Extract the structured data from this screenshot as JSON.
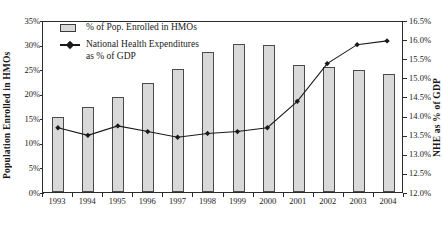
{
  "chart_data": {
    "type": "bar",
    "title": "",
    "subtitle": "",
    "xlabel": "",
    "ylabel": "Population  Enrolled  in  HMOs",
    "y2label": "NHE as % of GDP",
    "categories": [
      "1993",
      "1994",
      "1995",
      "1996",
      "1997",
      "1998",
      "1999",
      "2000",
      "2001",
      "2002",
      "2003",
      "2004"
    ],
    "grid": false,
    "legend_position": "top-left",
    "ylim": [
      0,
      35
    ],
    "y2lim": [
      12.0,
      16.5
    ],
    "yticks": [
      "0%",
      "5%",
      "10%",
      "15%",
      "20%",
      "25%",
      "30%",
      "35%"
    ],
    "ytick_values": [
      0,
      5,
      10,
      15,
      20,
      25,
      30,
      35
    ],
    "y2ticks": [
      "12.0%",
      "12.5%",
      "13.0%",
      "13.5%",
      "14.0%",
      "14.5%",
      "15.0%",
      "15.5%",
      "16.0%",
      "16.5%"
    ],
    "y2tick_values": [
      12.0,
      12.5,
      13.0,
      13.5,
      14.0,
      14.5,
      15.0,
      15.5,
      16.0,
      16.5
    ],
    "series": [
      {
        "name": "% of Pop. Enrolled in HMOs",
        "type": "bar",
        "axis": "left",
        "unit": "%",
        "color": "#d9d9d9",
        "edge_color": "#4a4a4a",
        "values": [
          15.2,
          17.3,
          19.4,
          22.1,
          25.0,
          28.4,
          30.2,
          30.0,
          25.8,
          25.4,
          24.8,
          24.0
        ]
      },
      {
        "name": "National Health Expenditures\nas % of GDP",
        "type": "line",
        "axis": "right",
        "unit": "%",
        "color": "#1a1a1a",
        "marker": "diamond",
        "values": [
          13.7,
          13.5,
          13.75,
          13.6,
          13.45,
          13.55,
          13.6,
          13.7,
          14.4,
          15.4,
          15.9,
          16.0
        ]
      }
    ],
    "legend": [
      {
        "label": "% of Pop. Enrolled in HMOs",
        "marker": "bar-swatch"
      },
      {
        "label": "National Health Expenditures\nas % of GDP",
        "marker": "line-diamond"
      }
    ]
  }
}
